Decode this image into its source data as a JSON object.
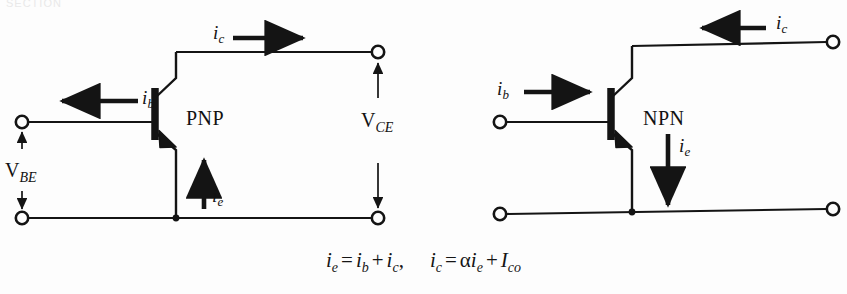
{
  "figure": {
    "ghost_fragment": "SECTION",
    "stroke_color": "#141414",
    "background_color": "#fdfdfd",
    "circuits": [
      {
        "name": "pnp-circuit",
        "type_label": "PNP",
        "currents": [
          {
            "name": "base-current",
            "symbol": "i",
            "subscript": "b",
            "direction": "left"
          },
          {
            "name": "collector-current",
            "symbol": "i",
            "subscript": "c",
            "direction": "right"
          },
          {
            "name": "emitter-current",
            "symbol": "i",
            "subscript": "e",
            "direction": "up"
          }
        ],
        "voltages": [
          {
            "name": "base-emitter-voltage",
            "symbol": "V",
            "subscript": "BE"
          },
          {
            "name": "collector-emitter-voltage",
            "symbol": "V",
            "subscript": "CE"
          }
        ]
      },
      {
        "name": "npn-circuit",
        "type_label": "NPN",
        "currents": [
          {
            "name": "base-current",
            "symbol": "i",
            "subscript": "b",
            "direction": "right"
          },
          {
            "name": "collector-current",
            "symbol": "i",
            "subscript": "c",
            "direction": "left"
          },
          {
            "name": "emitter-current",
            "symbol": "i",
            "subscript": "e",
            "direction": "down"
          }
        ],
        "voltages": []
      }
    ]
  },
  "equation": {
    "first": {
      "lhs_symbol": "i",
      "lhs_sub": "e",
      "eq": "=",
      "t1_symbol": "i",
      "t1_sub": "b",
      "plus": "+",
      "t2_symbol": "i",
      "t2_sub": "c",
      "comma": ","
    },
    "second": {
      "lhs_symbol": "i",
      "lhs_sub": "c",
      "eq": "=",
      "alpha": "α",
      "t1_symbol": "i",
      "t1_sub": "e",
      "plus": "+",
      "t2_symbol": "I",
      "t2_sub": "co"
    }
  }
}
